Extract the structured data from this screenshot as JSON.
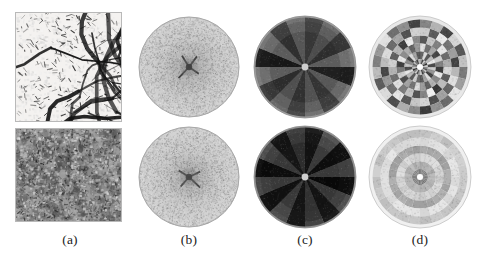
{
  "figure": {
    "background_color": "#ffffff",
    "rows": 2,
    "columns": 4,
    "column_labels": [
      {
        "id": "a",
        "text": "(a)",
        "center_x": 70,
        "description": "input grayscale texture image"
      },
      {
        "id": "b",
        "text": "(b)",
        "center_x": 189,
        "description": "fourier power spectrum disk"
      },
      {
        "id": "c",
        "text": "(c)",
        "center_x": 305,
        "description": "angular sector decomposition"
      },
      {
        "id": "d",
        "text": "(d)",
        "center_x": 420,
        "description": "polar wedge-ring feature map"
      }
    ]
  },
  "panels": {
    "row1": {
      "name": "branching-vessel-texture-row",
      "a": {
        "name": "source-image-branching",
        "x": 15,
        "y": 12,
        "w": 107,
        "h": 110,
        "kind": "line-network",
        "background": "#f4f2f0",
        "ink": "#141414",
        "density": 0.42,
        "anisotropy": 0.72,
        "dominant_orientation_deg": 20
      },
      "b": {
        "name": "fourier-spectrum-disk",
        "cx": 189,
        "cy": 67,
        "r": 50,
        "kind": "noisy-disk",
        "fill_light": "#c9c9c9",
        "fill_dark": "#9a9a9a",
        "center_spot": "#2b2b2b",
        "center_star_arms": 4,
        "grain": 0.3
      },
      "c": {
        "name": "angular-sector-map",
        "cx": 305,
        "cy": 67,
        "r": 51,
        "kind": "sector-wedges",
        "sectors": 16,
        "rings": 3,
        "outer_rim": "#9e9e9e",
        "sector_values": [
          0.26,
          0.4,
          0.22,
          0.45,
          0.13,
          0.44,
          0.25,
          0.42,
          0.26,
          0.4,
          0.22,
          0.45,
          0.13,
          0.44,
          0.25,
          0.42
        ],
        "ring_scales": [
          0.72,
          0.92,
          1.0
        ]
      },
      "d": {
        "name": "polar-wedge-ring-map",
        "cx": 420,
        "cy": 67,
        "r": 51,
        "kind": "polar-grid",
        "sectors": 24,
        "rings": 6,
        "outer_rim": "#e8e8e8",
        "mean_level": 0.62,
        "contrast": 0.46,
        "anisotropic": true,
        "cell_values": [
          [
            0.72,
            0.3,
            0.82,
            0.55,
            0.2,
            0.88,
            0.6,
            0.35,
            0.78,
            0.48,
            0.25,
            0.85,
            0.7,
            0.32,
            0.8,
            0.52,
            0.22,
            0.86,
            0.62,
            0.38,
            0.76,
            0.46,
            0.28,
            0.84
          ],
          [
            0.4,
            0.86,
            0.35,
            0.74,
            0.92,
            0.3,
            0.8,
            0.58,
            0.26,
            0.88,
            0.66,
            0.34,
            0.42,
            0.84,
            0.36,
            0.72,
            0.9,
            0.32,
            0.78,
            0.56,
            0.28,
            0.86,
            0.64,
            0.36
          ],
          [
            0.88,
            0.44,
            0.66,
            0.28,
            0.8,
            0.5,
            0.24,
            0.92,
            0.54,
            0.7,
            0.38,
            0.62,
            0.86,
            0.46,
            0.64,
            0.3,
            0.82,
            0.48,
            0.26,
            0.9,
            0.56,
            0.68,
            0.4,
            0.6
          ],
          [
            0.34,
            0.78,
            0.5,
            0.9,
            0.42,
            0.68,
            0.84,
            0.36,
            0.74,
            0.22,
            0.94,
            0.52,
            0.32,
            0.76,
            0.48,
            0.88,
            0.44,
            0.7,
            0.82,
            0.38,
            0.72,
            0.24,
            0.92,
            0.54
          ],
          [
            0.8,
            0.36,
            0.92,
            0.46,
            0.62,
            0.26,
            0.72,
            0.88,
            0.4,
            0.64,
            0.3,
            0.84,
            0.78,
            0.34,
            0.9,
            0.44,
            0.6,
            0.28,
            0.74,
            0.86,
            0.42,
            0.66,
            0.32,
            0.82
          ],
          [
            0.52,
            0.7,
            0.28,
            0.84,
            0.34,
            0.76,
            0.48,
            0.62,
            0.9,
            0.42,
            0.58,
            0.24,
            0.54,
            0.68,
            0.3,
            0.86,
            0.36,
            0.74,
            0.5,
            0.6,
            0.88,
            0.44,
            0.56,
            0.26
          ]
        ]
      }
    },
    "row2": {
      "name": "isotropic-noise-texture-row",
      "a": {
        "name": "source-image-mottled",
        "x": 15,
        "y": 128,
        "w": 107,
        "h": 94,
        "kind": "mottled-noise",
        "background": "#9b9b9b",
        "ink": "#2e2e2e",
        "density": 0.55,
        "anisotropy": 0.08,
        "dominant_orientation_deg": 0
      },
      "b": {
        "name": "fourier-spectrum-disk",
        "cx": 189,
        "cy": 177,
        "r": 50,
        "kind": "noisy-disk",
        "fill_light": "#cccccc",
        "fill_dark": "#9f9f9f",
        "center_spot": "#333333",
        "center_star_arms": 4,
        "grain": 0.3
      },
      "c": {
        "name": "angular-sector-map",
        "cx": 305,
        "cy": 177,
        "r": 51,
        "kind": "sector-wedges",
        "sectors": 16,
        "rings": 3,
        "outer_rim": "#8f8f8f",
        "sector_values": [
          0.1,
          0.3,
          0.08,
          0.26,
          0.06,
          0.28,
          0.09,
          0.24,
          0.1,
          0.3,
          0.08,
          0.26,
          0.06,
          0.28,
          0.09,
          0.24
        ],
        "ring_scales": [
          0.7,
          0.9,
          1.0
        ]
      },
      "d": {
        "name": "polar-wedge-ring-map",
        "cx": 420,
        "cy": 177,
        "r": 51,
        "kind": "polar-grid",
        "sectors": 24,
        "rings": 6,
        "outer_rim": "#f0f0f0",
        "mean_level": 0.74,
        "contrast": 0.16,
        "anisotropic": false,
        "ring_values": [
          0.52,
          0.7,
          0.84,
          0.66,
          0.88,
          0.78
        ]
      }
    }
  }
}
